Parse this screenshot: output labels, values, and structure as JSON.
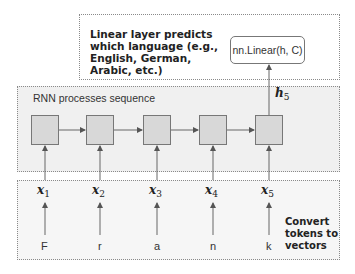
{
  "top_box": {
    "note": "Linear layer predicts which language (e.g., English, German, Arabic, etc.)",
    "linear_label": "nn.Linear(h, C)"
  },
  "rnn_box": {
    "label": "RNN processes sequence",
    "hidden_output": {
      "symbol": "h",
      "subscript": "5"
    },
    "cell_count": 5
  },
  "embed_box": {
    "note": "Convert tokens to vectors",
    "vectors": [
      {
        "symbol": "x",
        "subscript": "1"
      },
      {
        "symbol": "x",
        "subscript": "2"
      },
      {
        "symbol": "x",
        "subscript": "3"
      },
      {
        "symbol": "x",
        "subscript": "4"
      },
      {
        "symbol": "x",
        "subscript": "5"
      }
    ],
    "tokens": [
      "F",
      "r",
      "a",
      "n",
      "k"
    ]
  },
  "colors": {
    "cell_fill": "#d8d8d8",
    "rnn_bg": "#f0f0f0",
    "stroke": "#777777"
  }
}
